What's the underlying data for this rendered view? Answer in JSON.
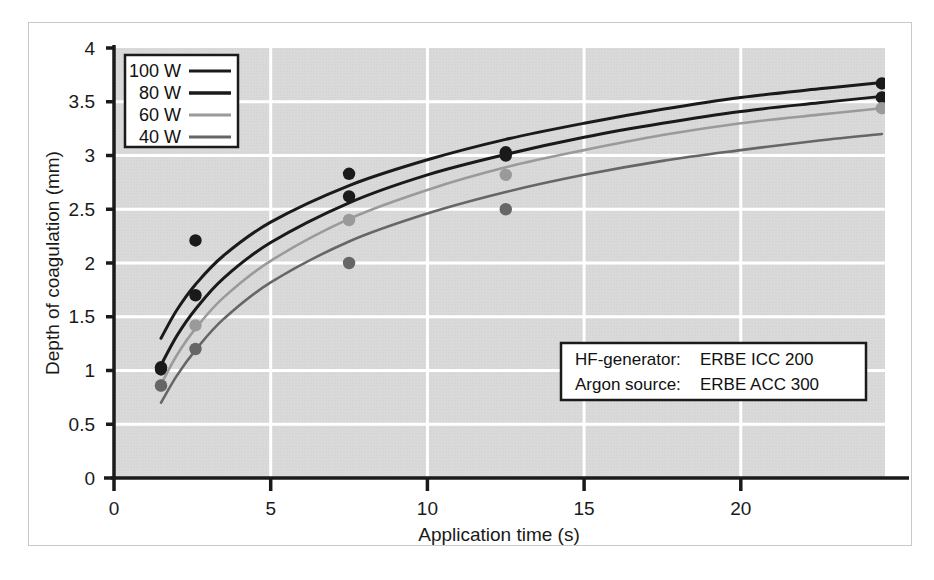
{
  "chart_data": {
    "type": "line",
    "title": "",
    "xlabel": "Application time (s)",
    "ylabel": "Depth of coagulation (mm)",
    "xlim": [
      0,
      24.6
    ],
    "ylim": [
      0,
      4
    ],
    "xticks": [
      0,
      5,
      10,
      15,
      20
    ],
    "xtick_labels": [
      "0",
      "5",
      "10",
      "15",
      "20"
    ],
    "yticks": [
      0,
      0.5,
      1,
      1.5,
      2,
      2.5,
      3,
      3.5,
      4
    ],
    "ytick_labels": [
      "0",
      "0.5",
      "1",
      "1.5",
      "2",
      "2.5",
      "3",
      "3.5",
      "4"
    ],
    "grid": true,
    "grid_color": "#ffffff",
    "plot_background": "#d8d8d8",
    "legend_position": "top-left",
    "series": [
      {
        "name": "100 W",
        "color": "#1a1a1a",
        "width": 3.0,
        "fit_points": [
          [
            1.5,
            1.3
          ],
          [
            2.0,
            1.56
          ],
          [
            2.6,
            1.8
          ],
          [
            3.5,
            2.07
          ],
          [
            5.0,
            2.38
          ],
          [
            7.5,
            2.72
          ],
          [
            10.0,
            2.96
          ],
          [
            12.5,
            3.15
          ],
          [
            15.0,
            3.3
          ],
          [
            17.5,
            3.43
          ],
          [
            20.0,
            3.54
          ],
          [
            22.5,
            3.62
          ],
          [
            24.5,
            3.68
          ]
        ],
        "data_points": [
          [
            1.5,
            1.03
          ],
          [
            2.6,
            2.21
          ],
          [
            7.5,
            2.83
          ],
          [
            12.5,
            3.03
          ],
          [
            24.5,
            3.67
          ]
        ]
      },
      {
        "name": "80 W",
        "color": "#1a1a1a",
        "width": 3.0,
        "fit_points": [
          [
            1.5,
            1.05
          ],
          [
            2.0,
            1.32
          ],
          [
            2.6,
            1.57
          ],
          [
            3.5,
            1.86
          ],
          [
            5.0,
            2.19
          ],
          [
            7.5,
            2.56
          ],
          [
            10.0,
            2.82
          ],
          [
            12.5,
            3.01
          ],
          [
            15.0,
            3.17
          ],
          [
            17.5,
            3.3
          ],
          [
            20.0,
            3.41
          ],
          [
            22.5,
            3.49
          ],
          [
            24.5,
            3.55
          ]
        ],
        "data_points": [
          [
            1.5,
            1.01
          ],
          [
            2.6,
            1.7
          ],
          [
            7.5,
            2.62
          ],
          [
            12.5,
            3.0
          ],
          [
            24.5,
            3.54
          ]
        ]
      },
      {
        "name": "60 W",
        "color": "#9a9a9a",
        "width": 2.6,
        "fit_points": [
          [
            1.5,
            0.87
          ],
          [
            2.0,
            1.14
          ],
          [
            2.6,
            1.39
          ],
          [
            3.5,
            1.68
          ],
          [
            5.0,
            2.02
          ],
          [
            7.5,
            2.41
          ],
          [
            10.0,
            2.68
          ],
          [
            12.5,
            2.89
          ],
          [
            15.0,
            3.05
          ],
          [
            17.5,
            3.19
          ],
          [
            20.0,
            3.3
          ],
          [
            22.5,
            3.38
          ],
          [
            24.5,
            3.44
          ]
        ],
        "data_points": [
          [
            1.5,
            0.86
          ],
          [
            2.6,
            1.42
          ],
          [
            7.5,
            2.4
          ],
          [
            12.5,
            2.82
          ],
          [
            24.5,
            3.44
          ]
        ]
      },
      {
        "name": "40 W",
        "color": "#666666",
        "width": 2.6,
        "fit_points": [
          [
            1.5,
            0.7
          ],
          [
            2.0,
            0.95
          ],
          [
            2.6,
            1.19
          ],
          [
            3.5,
            1.48
          ],
          [
            5.0,
            1.82
          ],
          [
            7.5,
            2.2
          ],
          [
            10.0,
            2.46
          ],
          [
            12.5,
            2.66
          ],
          [
            15.0,
            2.82
          ],
          [
            17.5,
            2.95
          ],
          [
            20.0,
            3.05
          ],
          [
            22.5,
            3.14
          ],
          [
            24.5,
            3.2
          ]
        ],
        "data_points": [
          [
            1.5,
            0.86
          ],
          [
            2.6,
            1.2
          ],
          [
            7.5,
            2.0
          ],
          [
            12.5,
            2.5
          ]
        ]
      }
    ],
    "annotations": [
      {
        "name": "hf-generator",
        "label": "HF-generator:",
        "value": "ERBE ICC  200"
      },
      {
        "name": "argon-source",
        "label": "Argon source:",
        "value": "ERBE ACC 300"
      }
    ]
  },
  "legend": {
    "items": [
      {
        "label": "100 W",
        "color": "#1a1a1a"
      },
      {
        "label": "80 W",
        "color": "#1a1a1a"
      },
      {
        "label": "60 W",
        "color": "#9a9a9a"
      },
      {
        "label": "40 W",
        "color": "#666666"
      }
    ]
  },
  "note_box": {
    "line1_label": "HF-generator:",
    "line1_value": "ERBE ICC  200",
    "line2_label": "Argon source:",
    "line2_value": "ERBE ACC 300"
  },
  "axes": {
    "x_title": "Application time (s)",
    "y_title": "Depth of coagulation (mm)",
    "x_ticks": [
      "0",
      "5",
      "10",
      "15",
      "20"
    ],
    "y_ticks": [
      "0",
      "0.5",
      "1",
      "1.5",
      "2",
      "2.5",
      "3",
      "3.5",
      "4"
    ]
  }
}
